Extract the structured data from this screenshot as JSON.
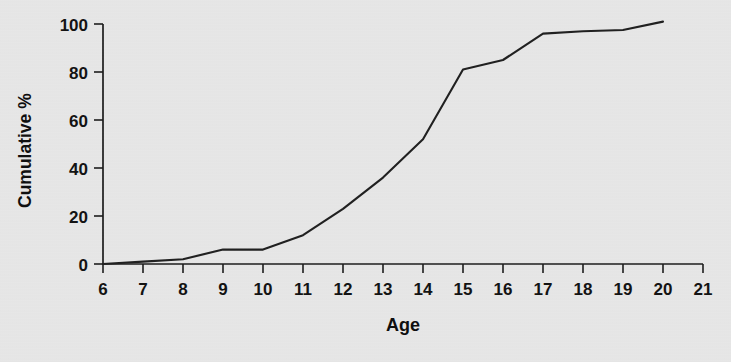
{
  "chart_data": {
    "type": "line",
    "title": "",
    "xlabel": "Age",
    "ylabel": "Cumulative %",
    "x": [
      6,
      7,
      8,
      9,
      10,
      11,
      12,
      13,
      14,
      15,
      16,
      17,
      18,
      19,
      20
    ],
    "values": [
      0,
      1,
      2,
      6,
      6,
      12,
      23,
      36,
      52,
      81,
      85,
      96,
      97,
      97.5,
      101
    ],
    "series": [
      {
        "name": "Cumulative %",
        "values": [
          0,
          1,
          2,
          6,
          6,
          12,
          23,
          36,
          52,
          81,
          85,
          96,
          97,
          97.5,
          101
        ]
      }
    ],
    "xlim": [
      6,
      21
    ],
    "ylim": [
      0,
      100
    ],
    "xticks": [
      6,
      7,
      8,
      9,
      10,
      11,
      12,
      13,
      14,
      15,
      16,
      17,
      18,
      19,
      20,
      21
    ],
    "xtick_labels": [
      "6",
      "7",
      "8",
      "9",
      "10",
      "11",
      "12",
      "13",
      "14",
      "15",
      "16",
      "17",
      "18",
      "19",
      "20",
      "21"
    ],
    "yticks": [
      0,
      20,
      40,
      60,
      80,
      100
    ],
    "ytick_labels": [
      "0",
      "20",
      "40",
      "60",
      "80",
      "100"
    ],
    "grid": false,
    "legend": null,
    "line_color": "#1f1f1f",
    "background_color": "#e8e8e8",
    "axis_color": "#1b1b1b"
  }
}
